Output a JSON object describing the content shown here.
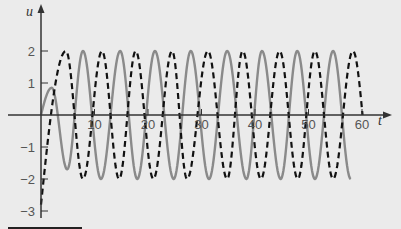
{
  "chart_data": {
    "type": "line",
    "title": "",
    "xlabel": "t",
    "ylabel": "u",
    "xlim": [
      0,
      62
    ],
    "ylim": [
      -3.2,
      2.6
    ],
    "grid": false,
    "legend": null,
    "x_ticks": [
      10,
      20,
      30,
      40,
      50,
      60
    ],
    "x_tick_labels": [
      "10",
      "20",
      "30",
      "40",
      "50",
      "60"
    ],
    "y_ticks": [
      2,
      1,
      -1,
      -2,
      -3
    ],
    "y_tick_labels": [
      "2",
      "1",
      "-1",
      "-2",
      "-3"
    ],
    "series": [
      {
        "name": "solid",
        "style": "solid",
        "color": "#8a8a8a",
        "extrema": [
          [
            0,
            0
          ],
          [
            2.0,
            0.85
          ],
          [
            4.9,
            -1.7
          ],
          [
            7.85,
            2
          ],
          [
            11.2,
            -2
          ],
          [
            14.8,
            2
          ],
          [
            18.0,
            -2
          ],
          [
            21.3,
            2
          ],
          [
            24.8,
            -2
          ],
          [
            28.0,
            2
          ],
          [
            31.4,
            -2
          ],
          [
            34.8,
            2
          ],
          [
            38.4,
            -2
          ],
          [
            41.3,
            2
          ],
          [
            44.8,
            -2
          ],
          [
            47.9,
            2
          ],
          [
            51.2,
            -2
          ],
          [
            54.6,
            2
          ],
          [
            57.9,
            -2
          ]
        ]
      },
      {
        "name": "dashed",
        "style": "dashed",
        "color": "#111111",
        "extrema": [
          [
            0,
            -2.8
          ],
          [
            4.67,
            2
          ],
          [
            7.85,
            -2
          ],
          [
            11.4,
            2
          ],
          [
            14.6,
            -2
          ],
          [
            17.7,
            2
          ],
          [
            21.0,
            -2
          ],
          [
            24.5,
            2
          ],
          [
            27.3,
            -2
          ],
          [
            31.2,
            2
          ],
          [
            34.8,
            -2
          ],
          [
            37.7,
            2
          ],
          [
            41.1,
            -2
          ],
          [
            44.6,
            2
          ],
          [
            48.0,
            -2
          ],
          [
            51.2,
            2
          ],
          [
            54.6,
            -2
          ],
          [
            58.3,
            2
          ],
          [
            60.1,
            0
          ]
        ]
      }
    ]
  },
  "colors": {
    "background": "#ebebeb",
    "axis": "#333333",
    "tick_text": "#555555"
  }
}
